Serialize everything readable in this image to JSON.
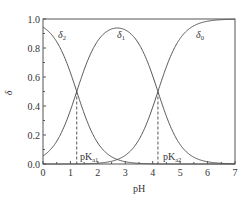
{
  "chart_data": {
    "type": "line",
    "title": "",
    "xlabel": "pH",
    "ylabel": "δ",
    "xlim": [
      0,
      7
    ],
    "ylim": [
      0.0,
      1.0
    ],
    "x_ticks": [
      "0",
      "1",
      "2",
      "3",
      "4",
      "5",
      "6",
      "7"
    ],
    "y_ticks": [
      "0.0",
      "0.2",
      "0.4",
      "0.6",
      "0.8",
      "1.0"
    ],
    "grid": false,
    "legend": "inline curve labels",
    "pKa1": 1.23,
    "pKa2": 4.19,
    "series": [
      {
        "name": "δ2",
        "label_main": "δ",
        "label_sub": "2",
        "x": [
          0,
          0.5,
          1.0,
          1.23,
          1.5,
          2.0,
          2.5,
          3.0,
          3.5,
          4.0,
          5.0,
          6.0,
          7.0
        ],
        "values": [
          0.94,
          0.84,
          0.63,
          0.5,
          0.35,
          0.14,
          0.05,
          0.015,
          0.004,
          0.001,
          0.0,
          0.0,
          0.0
        ]
      },
      {
        "name": "δ1",
        "label_main": "δ",
        "label_sub": "1",
        "x": [
          0,
          0.5,
          1.0,
          1.23,
          1.5,
          2.0,
          2.5,
          2.7,
          3.0,
          3.5,
          4.0,
          4.19,
          4.5,
          5.0,
          6.0,
          7.0
        ],
        "values": [
          0.06,
          0.16,
          0.37,
          0.5,
          0.65,
          0.85,
          0.93,
          0.94,
          0.92,
          0.82,
          0.6,
          0.5,
          0.33,
          0.13,
          0.015,
          0.002
        ]
      },
      {
        "name": "δ0",
        "label_main": "δ",
        "label_sub": "0",
        "x": [
          0,
          1.0,
          2.0,
          2.5,
          3.0,
          3.5,
          4.0,
          4.19,
          4.5,
          5.0,
          5.5,
          6.0,
          7.0
        ],
        "values": [
          0.0,
          0.0,
          0.006,
          0.02,
          0.06,
          0.17,
          0.39,
          0.5,
          0.67,
          0.87,
          0.95,
          0.98,
          1.0
        ]
      }
    ],
    "annotations": [
      {
        "text_main": "pK",
        "text_sub": "a1",
        "x": 1.23,
        "type": "dashed-vline"
      },
      {
        "text_main": "pK",
        "text_sub": "a2",
        "x": 4.19,
        "type": "dashed-vline"
      }
    ]
  },
  "colors": {
    "line": "#555555",
    "axis": "#555555",
    "text": "#333333",
    "background": "#ffffff"
  }
}
